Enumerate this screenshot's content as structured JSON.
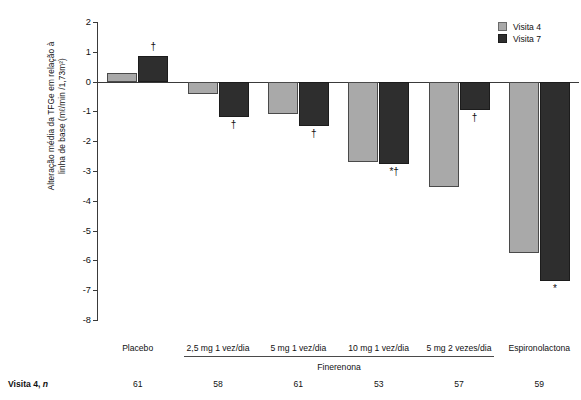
{
  "axis": {
    "y_title": "Alteração média da TFGe em relação à\nlinha de base (mℓ/min /1,73m²)",
    "y_ticks": [
      "2",
      "1",
      "0",
      "-1",
      "-2",
      "-3",
      "-4",
      "-5",
      "-6",
      "-7",
      "-8"
    ]
  },
  "legend": {
    "items": [
      {
        "label": "Visita 4",
        "color": "#a9a9a9"
      },
      {
        "label": "Visita 7",
        "color": "#2e2e2e"
      }
    ]
  },
  "categories": [
    "Placebo",
    "2,5 mg 1 vez/dia",
    "5 mg 1 vez/dia",
    "10 mg 1 vez/dia",
    "5 mg 2 vezes/dia",
    "Espironolactona"
  ],
  "group_bracket": {
    "label": "Finerenona"
  },
  "n_row": {
    "label_bold": "Visita 4",
    "label_rest": ", ",
    "label_italic": "n",
    "values": [
      "61",
      "58",
      "61",
      "53",
      "57",
      "59"
    ]
  },
  "annotations": [
    {
      "group": 0,
      "series": "Visita 7",
      "text": "†"
    },
    {
      "group": 1,
      "series": "Visita 7",
      "text": "†"
    },
    {
      "group": 2,
      "series": "Visita 7",
      "text": "†"
    },
    {
      "group": 3,
      "series": "Visita 7",
      "text": "*†"
    },
    {
      "group": 4,
      "series": "Visita 7",
      "text": "†"
    },
    {
      "group": 5,
      "series": "Visita 7",
      "text": "*"
    }
  ],
  "chart_data": {
    "type": "bar",
    "title": "",
    "xlabel": "",
    "ylabel": "Alteração média da TFGe em relação à linha de base (mℓ/min /1,73m²)",
    "ylim": [
      -8,
      2
    ],
    "yticks": [
      2,
      1,
      0,
      -1,
      -2,
      -3,
      -4,
      -5,
      -6,
      -7,
      -8
    ],
    "grid": false,
    "legend_position": "top-right",
    "categories": [
      "Placebo",
      "2,5 mg 1 vez/dia",
      "5 mg 1 vez/dia",
      "10 mg 1 vez/dia",
      "5 mg 2 vezes/dia",
      "Espironolactona"
    ],
    "series": [
      {
        "name": "Visita 4",
        "color": "#a9a9a9",
        "values": [
          0.3,
          -0.4,
          -1.1,
          -2.7,
          -3.55,
          -5.75
        ]
      },
      {
        "name": "Visita 7",
        "color": "#2e2e2e",
        "values": [
          0.85,
          -1.2,
          -1.5,
          -2.75,
          -0.95,
          -6.7
        ]
      }
    ],
    "n": [
      61,
      58,
      61,
      53,
      57,
      59
    ],
    "annotations": [
      "†",
      "†",
      "†",
      "*†",
      "†",
      "*"
    ]
  }
}
